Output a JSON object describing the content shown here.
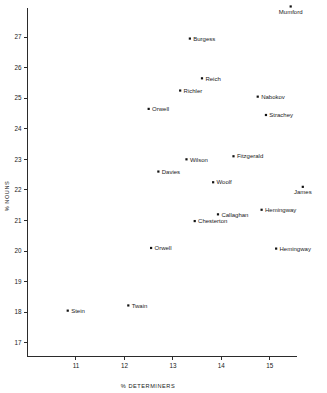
{
  "chart_data": {
    "type": "scatter",
    "title": "",
    "xlabel": "% DETERMINERS",
    "ylabel": "% NOUNS",
    "xlim": [
      10.0,
      15.55
    ],
    "ylim": [
      16.55,
      27.95
    ],
    "xticks": [
      11,
      12,
      13,
      14,
      15
    ],
    "yticks": [
      17,
      18,
      19,
      20,
      21,
      22,
      23,
      24,
      25,
      26,
      27
    ],
    "xtick_labels": [
      "11",
      "12",
      "13",
      "14",
      "15"
    ],
    "ytick_labels": [
      "17",
      "18",
      "19",
      "20",
      "21",
      "22",
      "23",
      "24",
      "25",
      "26",
      "27"
    ],
    "grid": false,
    "legend": "none",
    "marker_color": "#131313",
    "axis_color": "#2b2b2b",
    "points": [
      {
        "label": "Mumford",
        "x": 15.43,
        "y": 28.0,
        "label_pos": "below"
      },
      {
        "label": "Burgess",
        "x": 13.35,
        "y": 26.95,
        "label_pos": "right"
      },
      {
        "label": "Reich",
        "x": 13.6,
        "y": 25.65,
        "label_pos": "right"
      },
      {
        "label": "Richler",
        "x": 13.15,
        "y": 25.25,
        "label_pos": "right"
      },
      {
        "label": "Nabokov",
        "x": 14.75,
        "y": 25.05,
        "label_pos": "right"
      },
      {
        "label": "Orwell",
        "x": 12.5,
        "y": 24.65,
        "label_pos": "right"
      },
      {
        "label": "Strachey",
        "x": 14.92,
        "y": 24.45,
        "label_pos": "right"
      },
      {
        "label": "Fitzgerald",
        "x": 14.25,
        "y": 23.1,
        "label_pos": "right"
      },
      {
        "label": "Wilson",
        "x": 13.28,
        "y": 23.0,
        "label_pos": "right"
      },
      {
        "label": "Davies",
        "x": 12.7,
        "y": 22.6,
        "label_pos": "right"
      },
      {
        "label": "Woolf",
        "x": 13.83,
        "y": 22.25,
        "label_pos": "right"
      },
      {
        "label": "James",
        "x": 15.68,
        "y": 22.1,
        "label_pos": "below"
      },
      {
        "label": "Hemingway",
        "x": 14.83,
        "y": 21.35,
        "label_pos": "right"
      },
      {
        "label": "Callaghan",
        "x": 13.93,
        "y": 21.2,
        "label_pos": "right"
      },
      {
        "label": "Chesterton",
        "x": 13.45,
        "y": 20.98,
        "label_pos": "right"
      },
      {
        "label": "Orwell",
        "x": 12.55,
        "y": 20.1,
        "label_pos": "right"
      },
      {
        "label": "Hemingway",
        "x": 15.13,
        "y": 20.08,
        "label_pos": "right"
      },
      {
        "label": "Twain",
        "x": 12.08,
        "y": 18.22,
        "label_pos": "right"
      },
      {
        "label": "Stein",
        "x": 10.83,
        "y": 18.05,
        "label_pos": "right"
      }
    ]
  }
}
